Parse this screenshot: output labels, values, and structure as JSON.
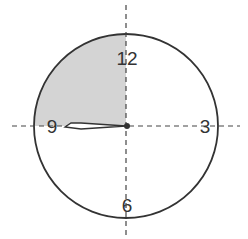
{
  "diagram": {
    "type": "clock-face",
    "numerals": {
      "twelve": "12",
      "three": "3",
      "six": "6",
      "nine": "9"
    },
    "shaded_region": "quadrant from 9 to 12",
    "hand": {
      "points_to": "9"
    },
    "axes": "dashed horizontal and vertical lines through center",
    "colors": {
      "outline": "#333333",
      "shade": "#d4d4d4",
      "background": "#ffffff"
    }
  }
}
